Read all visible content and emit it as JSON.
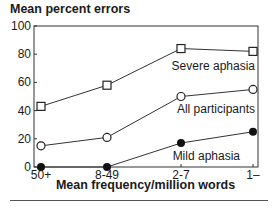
{
  "chart_data": {
    "type": "line",
    "title": "Mean percent errors",
    "xlabel": "Mean frequency/million words",
    "ylabel": "Mean percent errors",
    "categories": [
      "50+",
      "8-49",
      "2-7",
      "1–"
    ],
    "yticks": [
      0,
      20,
      40,
      60,
      80,
      100
    ],
    "ylim": [
      0,
      100
    ],
    "grid": false,
    "legend": "inline annotations",
    "series": [
      {
        "name": "Severe aphasia",
        "marker": "open-square",
        "values": [
          43,
          58,
          84,
          82
        ]
      },
      {
        "name": "All participants",
        "marker": "open-circle",
        "values": [
          15,
          21,
          50,
          55
        ]
      },
      {
        "name": "Mild aphasia",
        "marker": "filled-circle",
        "values": [
          0,
          0,
          17,
          25
        ]
      }
    ]
  }
}
